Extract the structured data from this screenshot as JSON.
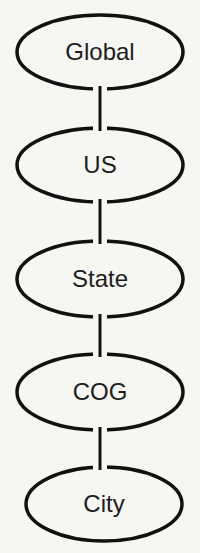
{
  "diagram": {
    "type": "hierarchy",
    "orientation": "vertical",
    "colors": {
      "background": "#f6f6f3",
      "stroke": "#111111",
      "text": "#1d1d1d"
    },
    "nodes": [
      {
        "id": "global",
        "label": "Global",
        "cx": 100,
        "cy": 52,
        "rx": 83,
        "ry": 37
      },
      {
        "id": "us",
        "label": "US",
        "cx": 100,
        "cy": 165,
        "rx": 83,
        "ry": 37
      },
      {
        "id": "state",
        "label": "State",
        "cx": 100,
        "cy": 279,
        "rx": 83,
        "ry": 38
      },
      {
        "id": "cog",
        "label": "COG",
        "cx": 100,
        "cy": 392,
        "rx": 83,
        "ry": 38
      },
      {
        "id": "city",
        "label": "City",
        "cx": 104,
        "cy": 504,
        "rx": 78,
        "ry": 37
      }
    ],
    "edges": [
      {
        "from": "global",
        "to": "us"
      },
      {
        "from": "us",
        "to": "state"
      },
      {
        "from": "state",
        "to": "cog"
      },
      {
        "from": "cog",
        "to": "city"
      }
    ]
  }
}
